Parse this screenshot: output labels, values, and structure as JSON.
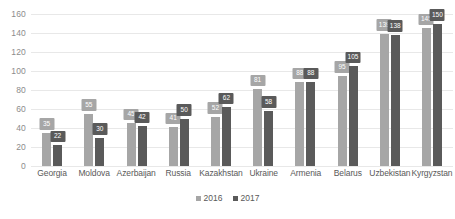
{
  "chart_data": {
    "type": "bar",
    "title": "",
    "subtitle": "",
    "xlabel": "",
    "ylabel": "",
    "ylim": [
      0,
      160
    ],
    "ytick_step": 20,
    "yticks": [
      160,
      140,
      120,
      100,
      80,
      60,
      40,
      20,
      0
    ],
    "grid": true,
    "legend_position": "bottom",
    "categories": [
      "Georgia",
      "Moldova",
      "Azerbaijan",
      "Russia",
      "Kazakhstan",
      "Ukraine",
      "Armenia",
      "Belarus",
      "Uzbekistan",
      "Kyrgyzstan"
    ],
    "series": [
      {
        "name": "2016",
        "color": "#a6a6a6",
        "values": [
          35,
          55,
          45,
          41,
          52,
          81,
          88,
          95,
          139,
          145
        ]
      },
      {
        "name": "2017",
        "color": "#5a5a5a",
        "values": [
          22,
          30,
          42,
          50,
          62,
          58,
          88,
          105,
          138,
          150
        ]
      }
    ]
  },
  "legend": {
    "items": [
      {
        "label": "2016",
        "series": "s2016"
      },
      {
        "label": "2017",
        "series": "s2017"
      }
    ]
  },
  "colors": {
    "series_2016": "#a6a6a6",
    "series_2017": "#5a5a5a",
    "gridline": "#e8e8e8",
    "axis_text": "#595959",
    "ytick_text": "#8c8c8c",
    "background": "#ffffff"
  }
}
